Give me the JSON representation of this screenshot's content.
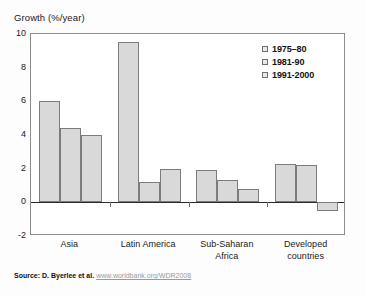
{
  "title": "Growth (%/year)",
  "source": {
    "prefix": "Source: D. Byerlee et al.",
    "url": "www.worldbank.org/WDR2008"
  },
  "legend": {
    "position": "top-right",
    "items": [
      {
        "label": "1975–80",
        "swatch": "legend-swatch-1975-80"
      },
      {
        "label": "1981-90",
        "swatch": "legend-swatch-1981-90"
      },
      {
        "label": "1991-2000",
        "swatch": "legend-swatch-1991-2000"
      }
    ]
  },
  "axes": {
    "y_ticks": [
      "10",
      "8",
      "6",
      "4",
      "2",
      "0",
      "-2"
    ],
    "x_categories": [
      {
        "line1": "Asia",
        "line2": ""
      },
      {
        "line1": "Latin America",
        "line2": ""
      },
      {
        "line1": "Sub-Saharan",
        "line2": "Africa"
      },
      {
        "line1": "Developed",
        "line2": "countries"
      }
    ]
  },
  "colors": {
    "bar_fill": "#d9d9d9",
    "bar_stroke": "#7c7c7c",
    "frame": "#8d8d8d",
    "zero_line": "#2a2a2a",
    "text": "#1a1a1a",
    "url": "#9a9a9a"
  },
  "chart_data": {
    "type": "bar",
    "title": "Growth (%/year)",
    "xlabel": "",
    "ylabel": "Growth (%/year)",
    "ylim": [
      -2,
      10
    ],
    "ytick_step": 2,
    "grid": false,
    "legend_position": "top-right",
    "categories": [
      "Asia",
      "Latin America",
      "Sub-Saharan Africa",
      "Developed countries"
    ],
    "series": [
      {
        "name": "1975–80",
        "values": [
          6.0,
          9.5,
          1.9,
          2.3
        ]
      },
      {
        "name": "1981-90",
        "values": [
          4.4,
          1.2,
          1.3,
          2.2
        ]
      },
      {
        "name": "1991-2000",
        "values": [
          4.0,
          2.0,
          0.8,
          -0.5
        ]
      }
    ],
    "annotations": [],
    "source": "Source: D. Byerlee et al. www.worldbank.org/WDR2008"
  }
}
